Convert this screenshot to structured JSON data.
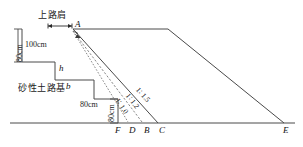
{
  "diagram": {
    "title_text": "上路肩",
    "subgrade_text": "砂性土路基",
    "dimensions": {
      "left_vertical": "80cm",
      "top_horizontal": "100cm",
      "step_vertical": "80cm",
      "step_horizontal": "80cm"
    },
    "variables": {
      "h": "h",
      "b": "b"
    },
    "slopes": [
      {
        "id": "slope-1-1-5",
        "label": "1∶ 1.5"
      },
      {
        "id": "slope-1-1-2",
        "label": "1∶ 1.2"
      },
      {
        "id": "slope-1-1-0",
        "label": "1∶ 1.0"
      }
    ],
    "points": {
      "A": "A",
      "F": "F",
      "D": "D",
      "B": "B",
      "C": "C",
      "E": "E"
    },
    "colors": {
      "line": "#4a4a4a",
      "dashed": "#6a6a6a",
      "text": "#1a1a1a",
      "background": "#ffffff"
    }
  }
}
